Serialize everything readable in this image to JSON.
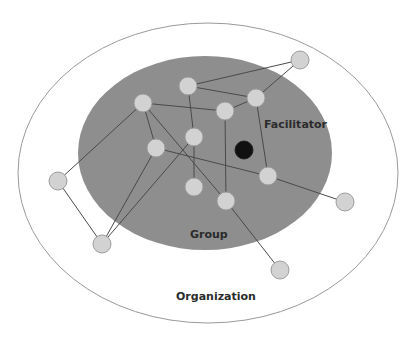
{
  "diagram": {
    "labels": {
      "facilitator": "Facilitator",
      "group": "Group",
      "organization": "Organization"
    },
    "colors": {
      "organization_fill": "#ffffff",
      "organization_stroke": "#9a9a9a",
      "group_fill": "#8e8e8e",
      "node_fill": "#d2d2d2",
      "facilitator_fill": "#111111",
      "edge": "#4a4a4a"
    },
    "nodes": [
      {
        "id": "A",
        "x": 300,
        "y": 60
      },
      {
        "id": "B",
        "x": 188,
        "y": 86
      },
      {
        "id": "C",
        "x": 256,
        "y": 98
      },
      {
        "id": "D",
        "x": 143,
        "y": 103
      },
      {
        "id": "E",
        "x": 225,
        "y": 111
      },
      {
        "id": "F",
        "x": 194,
        "y": 137
      },
      {
        "id": "G",
        "x": 156,
        "y": 148
      },
      {
        "id": "H",
        "x": 58,
        "y": 181
      },
      {
        "id": "I",
        "x": 268,
        "y": 176
      },
      {
        "id": "J",
        "x": 194,
        "y": 187
      },
      {
        "id": "K",
        "x": 226,
        "y": 201
      },
      {
        "id": "L",
        "x": 345,
        "y": 202
      },
      {
        "id": "M",
        "x": 102,
        "y": 244
      },
      {
        "id": "N",
        "x": 280,
        "y": 270
      }
    ],
    "facilitator_node": {
      "x": 244,
      "y": 150
    },
    "edges": [
      [
        "B",
        "A"
      ],
      [
        "A",
        "C"
      ],
      [
        "B",
        "C"
      ],
      [
        "B",
        "F"
      ],
      [
        "C",
        "E"
      ],
      [
        "D",
        "E"
      ],
      [
        "D",
        "G"
      ],
      [
        "D",
        "K"
      ],
      [
        "D",
        "H"
      ],
      [
        "H",
        "M"
      ],
      [
        "M",
        "G"
      ],
      [
        "M",
        "F"
      ],
      [
        "F",
        "J"
      ],
      [
        "G",
        "I"
      ],
      [
        "E",
        "K"
      ],
      [
        "C",
        "I"
      ],
      [
        "I",
        "L"
      ],
      [
        "K",
        "N"
      ]
    ]
  }
}
